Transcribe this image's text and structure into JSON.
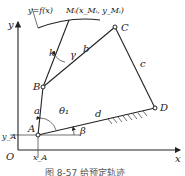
{
  "figure": {
    "caption": "图 8-57  给预定轨迹",
    "curve_label": "y=f(x)",
    "point_M_label": "Mᵢ(x_Mᵢ, y_Mᵢ)",
    "points": {
      "A": "A",
      "B": "B",
      "C": "C",
      "D": "D",
      "O": "O"
    },
    "links": {
      "a": "a",
      "b": "b",
      "c": "c",
      "d": "d",
      "k": "k"
    },
    "angles": {
      "theta1": "θ₁",
      "beta": "β",
      "gamma": "γ"
    },
    "axes": {
      "x": "x",
      "y": "y",
      "xA": "x_A",
      "yA": "y_A"
    }
  }
}
